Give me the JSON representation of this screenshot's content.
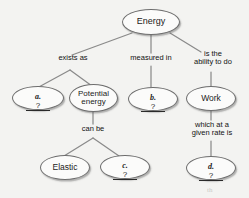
{
  "diagram": {
    "background_color": "#f3f3f1",
    "node_fill": "#fbfbfa",
    "node_stroke": "#6d6d6d",
    "edge_stroke": "#8a8a8a",
    "text_color": "#1b1b1b"
  },
  "nodes": {
    "energy": {
      "label": "Energy"
    },
    "blank_a": {
      "tag": "a.",
      "value": "?"
    },
    "potential_energy": {
      "label": "Potential\nenergy"
    },
    "blank_b": {
      "tag": "b.",
      "value": "?"
    },
    "work": {
      "label": "Work"
    },
    "elastic": {
      "label": "Elastic"
    },
    "blank_c": {
      "tag": "c.",
      "value": "?"
    },
    "blank_d": {
      "tag": "d.",
      "value": "?"
    }
  },
  "edge_labels": {
    "exists_as": "exists as",
    "measured_in": "measured in",
    "is_the_ability_to_do": "is the\nability to do",
    "can_be": "can be",
    "which_at_a_given_rate_is": "which at a\ngiven rate is"
  },
  "artifact": {
    "mark": "th"
  }
}
